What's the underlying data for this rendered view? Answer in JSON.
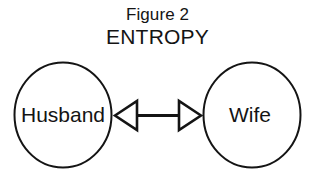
{
  "figure": {
    "background_color": "#ffffff",
    "ink_color": "#141414",
    "title": {
      "line_1": "Figure 2",
      "line_2": "ENTROPY"
    },
    "nodes": [
      {
        "id": "husband",
        "label": "Husband",
        "shape": "circle",
        "cx": 63,
        "cy": 115,
        "rx": 49,
        "ry": 53,
        "fill": "#ffffff",
        "stroke": "#141414"
      },
      {
        "id": "wife",
        "label": "Wife",
        "shape": "circle",
        "cx": 252,
        "cy": 115,
        "rx": 49,
        "ry": 53,
        "fill": "#ffffff",
        "stroke": "#141414"
      }
    ],
    "connector": {
      "id": "entropy-link",
      "type": "double-headed-arrow",
      "label": "",
      "from": "husband",
      "to": "wife",
      "arrowhead_style": "open-triangle",
      "x_start": 114,
      "x_end": 201,
      "y": 115,
      "stroke": "#141414"
    }
  }
}
